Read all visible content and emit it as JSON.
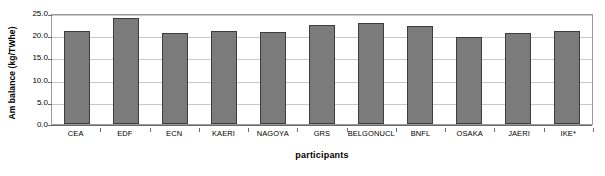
{
  "chart_data": {
    "type": "bar",
    "title": "",
    "xlabel": "participants",
    "ylabel": "Am balance  (kg/TWhe)",
    "categories": [
      "CEA",
      "EDF",
      "ECN",
      "KAERI",
      "NAGOYA",
      "GRS",
      "BELGONUCL",
      "BNFL",
      "OSAKA",
      "JAERI",
      "IKE*"
    ],
    "values": [
      20.9,
      23.9,
      20.6,
      20.9,
      20.7,
      22.4,
      22.8,
      22.0,
      19.5,
      20.5,
      20.85
    ],
    "ylim": [
      0.0,
      25.0
    ],
    "yticks": [
      0.0,
      5.0,
      10.0,
      15.0,
      20.0,
      25.0
    ],
    "ytick_labels": [
      "0.0",
      "5.0",
      "10.0",
      "15.0",
      "20.0",
      "25.0"
    ],
    "grid": true,
    "legend": null,
    "bar_color": "#7b7b7b",
    "bar_edge_color": "#3d3d3d",
    "gridline_color": "#c8c8c8",
    "axis_color": "#6b6b6b"
  }
}
